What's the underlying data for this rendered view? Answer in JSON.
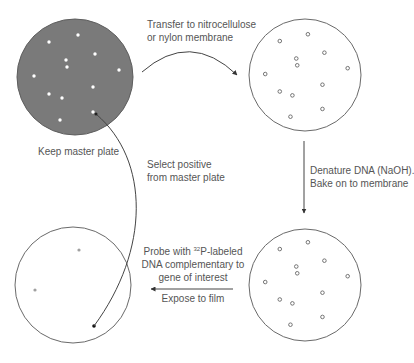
{
  "diagram": {
    "colors": {
      "master_plate_fill": "#7a7a7a",
      "outline": "#6a6a6a",
      "colony_light": "#ffffff",
      "faint_spot": "#a0a0a0",
      "positive_spot": "#111111",
      "text": "#555555",
      "arrow": "#444444"
    },
    "plates": [
      {
        "id": "master-plate",
        "label": "Keep master plate",
        "cx": 75,
        "cy": 77,
        "r": 58,
        "filled": true
      },
      {
        "id": "membrane-plate",
        "label": "",
        "cx": 305,
        "cy": 75,
        "r": 56,
        "filled": false
      },
      {
        "id": "denatured-membrane",
        "label": "",
        "cx": 305,
        "cy": 285,
        "r": 56,
        "filled": false
      },
      {
        "id": "film",
        "label": "",
        "cx": 73,
        "cy": 285,
        "r": 58,
        "filled": false
      }
    ],
    "colonies": [
      [
        49,
        42
      ],
      [
        78,
        35
      ],
      [
        95,
        54
      ],
      [
        66,
        60
      ],
      [
        67,
        67
      ],
      [
        119,
        70
      ],
      [
        34,
        76
      ],
      [
        93,
        87
      ],
      [
        49,
        94
      ],
      [
        62,
        98
      ],
      [
        93,
        112
      ],
      [
        60,
        120
      ]
    ],
    "steps": {
      "transfer": {
        "line1": "Transfer to nitrocellulose",
        "line2": "or nylon membrane"
      },
      "denature": {
        "line1": "Denature DNA (NaOH).",
        "line2": "Bake on to membrane"
      },
      "probe": {
        "line1_pre": "Probe with ",
        "line1_sup": "32",
        "line1_post": "P-labeled",
        "line2": "DNA complementary to",
        "line3": "gene of interest"
      },
      "expose": {
        "text": "Expose to film"
      },
      "select": {
        "line1": "Select positive",
        "line2": "from master plate"
      },
      "keep": {
        "text": "Keep master plate"
      }
    },
    "film_spots": [
      {
        "x": 79,
        "y": 250,
        "type": "faint"
      },
      {
        "x": 35,
        "y": 290,
        "type": "faint"
      },
      {
        "x": 94,
        "y": 326,
        "type": "positive"
      }
    ]
  }
}
